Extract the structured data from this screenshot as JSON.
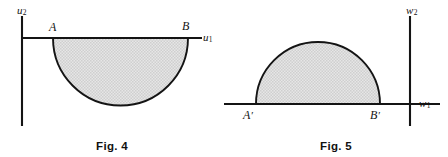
{
  "sheet": {
    "background_color": "#ffffff",
    "ink_color": "#141414",
    "shade_color": "#d9d9d9"
  },
  "figures": [
    {
      "id": "fig-4",
      "caption": "Fig. 4",
      "axes": {
        "vertical_label": "u",
        "vertical_subscript": "2",
        "horizontal_label": "u",
        "horizontal_subscript": "1"
      },
      "points": [
        {
          "label": "A",
          "prime": ""
        },
        {
          "label": "B",
          "prime": ""
        }
      ],
      "region": {
        "shape": "semicircular-disk",
        "orientation": "below-axis",
        "boundary_endpoints": [
          "A",
          "B"
        ]
      }
    },
    {
      "id": "fig-5",
      "caption": "Fig. 5",
      "axes": {
        "vertical_label": "w",
        "vertical_subscript": "2",
        "horizontal_label": "w",
        "horizontal_subscript": "1"
      },
      "points": [
        {
          "label": "A",
          "prime": "′"
        },
        {
          "label": "B",
          "prime": "′"
        }
      ],
      "region": {
        "shape": "semicircular-disk",
        "orientation": "above-axis",
        "boundary_endpoints": [
          "A′",
          "B′"
        ]
      }
    }
  ]
}
